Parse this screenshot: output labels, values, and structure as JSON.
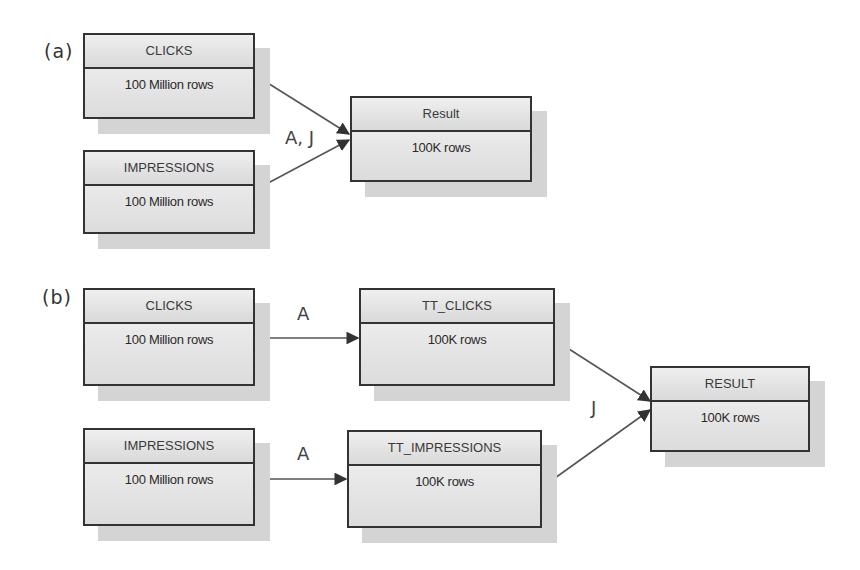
{
  "diagram": {
    "panels": [
      {
        "label": "(a)",
        "nodes": [
          {
            "id": "a_clicks",
            "title": "CLICKS",
            "rows": "100 Million rows"
          },
          {
            "id": "a_impressions",
            "title": "IMPRESSIONS",
            "rows": "100 Million rows"
          },
          {
            "id": "a_result",
            "title": "Result",
            "rows": "100K rows"
          }
        ],
        "edges": [
          {
            "from": "a_clicks",
            "to": "a_result"
          },
          {
            "from": "a_impressions",
            "to": "a_result"
          }
        ],
        "edge_labels": [
          "A, J"
        ]
      },
      {
        "label": "(b)",
        "nodes": [
          {
            "id": "b_clicks",
            "title": "CLICKS",
            "rows": "100 Million rows"
          },
          {
            "id": "b_tt_clicks",
            "title": "TT_CLICKS",
            "rows": "100K rows"
          },
          {
            "id": "b_impressions",
            "title": "IMPRESSIONS",
            "rows": "100 Million rows"
          },
          {
            "id": "b_tt_impressions",
            "title": "TT_IMPRESSIONS",
            "rows": "100K rows"
          },
          {
            "id": "b_result",
            "title": "RESULT",
            "rows": "100K rows"
          }
        ],
        "edges": [
          {
            "from": "b_clicks",
            "to": "b_tt_clicks",
            "label": "A"
          },
          {
            "from": "b_impressions",
            "to": "b_tt_impressions",
            "label": "A"
          },
          {
            "from": "b_tt_clicks",
            "to": "b_result"
          },
          {
            "from": "b_tt_impressions",
            "to": "b_result"
          }
        ],
        "edge_labels": [
          "A",
          "A",
          "J"
        ]
      }
    ]
  }
}
